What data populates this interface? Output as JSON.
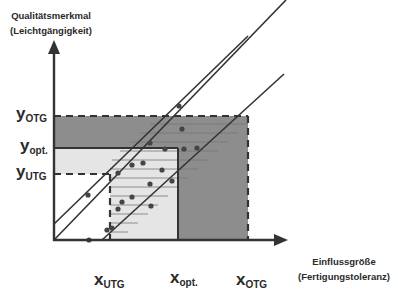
{
  "diagram": {
    "y_axis_title": [
      "Qualitätsmerkmal",
      "(Leichtgängigkeit)"
    ],
    "x_axis_title": [
      "Einflussgröße",
      "(Fertigungstoleranz)"
    ],
    "y_ticks": [
      {
        "base": "y",
        "sub": "OTG"
      },
      {
        "base": "y",
        "sub": "opt."
      },
      {
        "base": "y",
        "sub": "UTG"
      }
    ],
    "x_ticks": [
      {
        "base": "x",
        "sub": "UTG"
      },
      {
        "base": "x",
        "sub": "opt."
      },
      {
        "base": "x",
        "sub": "OTG"
      }
    ],
    "colors": {
      "dark_region": "#8c8c8c",
      "light_region": "#e4e4e4",
      "lines": "#333333"
    }
  }
}
